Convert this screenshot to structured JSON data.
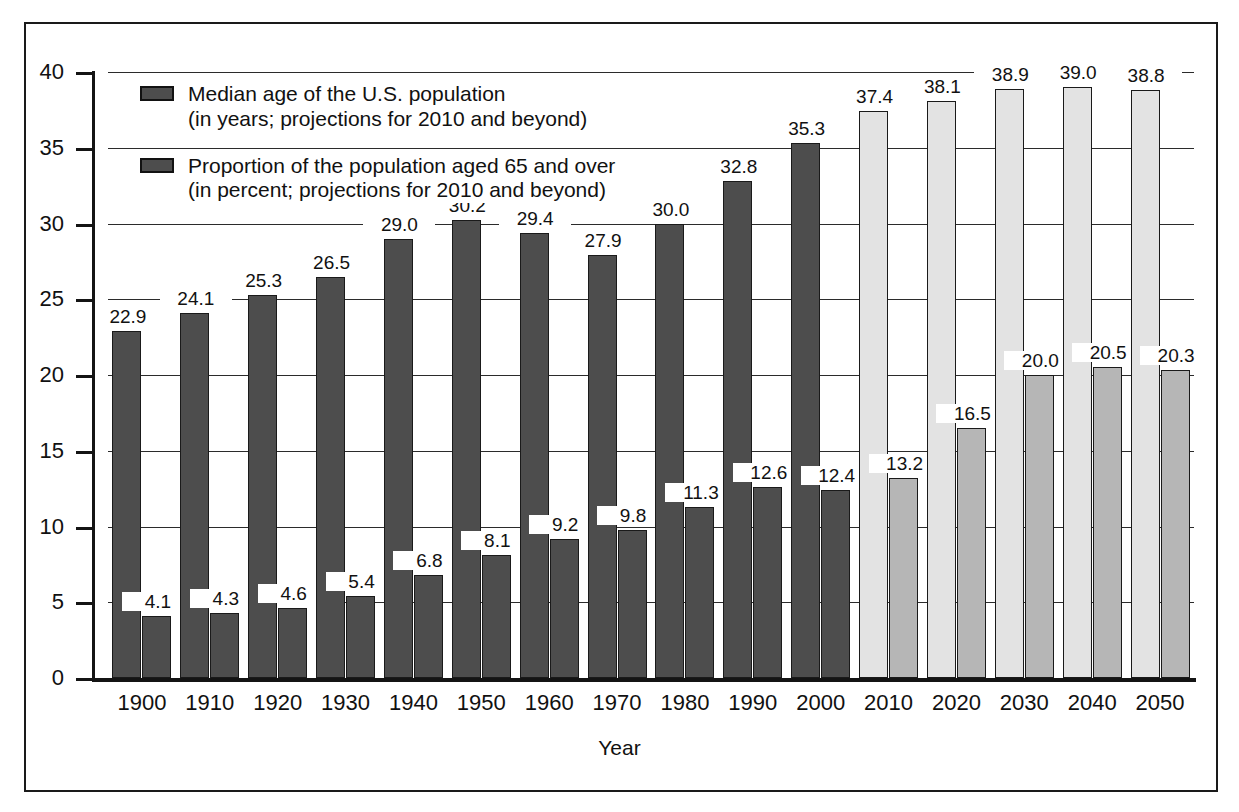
{
  "figure": {
    "frame_color": "#1a1a1a",
    "background": "#ffffff"
  },
  "legend": {
    "position": "inside-top-left",
    "entries": [
      {
        "swatch_color": "#4d4d4d",
        "line1": "Median age of the U.S. population",
        "line2": "(in years; projections for 2010 and beyond)"
      },
      {
        "swatch_color": "#4d4d4d",
        "line1": "Proportion of the population aged 65 and over",
        "line2": "(in percent; projections for 2010 and beyond)"
      }
    ]
  },
  "chart_data": {
    "type": "bar",
    "title": "",
    "subtitle": "",
    "xlabel": "Year",
    "ylabel": "",
    "ylim": [
      0,
      40
    ],
    "ytick_values": [
      0,
      5,
      10,
      15,
      20,
      25,
      30,
      35,
      40
    ],
    "ytick_labels": [
      "0",
      "5",
      "10",
      "15",
      "20",
      "25",
      "30",
      "35",
      "40"
    ],
    "grid": true,
    "grid_axis": "y",
    "legend_position": "upper left inside",
    "categories": [
      "1900",
      "1910",
      "1920",
      "1930",
      "1940",
      "1950",
      "1960",
      "1970",
      "1980",
      "1990",
      "2000",
      "2010",
      "2020",
      "2030",
      "2040",
      "2050"
    ],
    "projection_from": "2010",
    "series": [
      {
        "name": "Median age of the U.S. population",
        "unit": "years",
        "color": "#4d4d4d",
        "projection_color": "#e3e3e3",
        "values": [
          22.9,
          24.1,
          25.3,
          26.5,
          29.0,
          30.2,
          29.4,
          27.9,
          30.0,
          32.8,
          35.3,
          37.4,
          38.1,
          38.9,
          39.0,
          38.8
        ],
        "labels": [
          "22.9",
          "24.1",
          "25.3",
          "26.5",
          "29.0",
          "30.2",
          "29.4",
          "27.9",
          "30.0",
          "32.8",
          "35.3",
          "37.4",
          "38.1",
          "38.9",
          "39.0",
          "38.8"
        ]
      },
      {
        "name": "Proportion of the population aged 65 and over",
        "unit": "percent",
        "color": "#4d4d4d",
        "projection_color": "#b6b6b6",
        "values": [
          4.1,
          4.3,
          4.6,
          5.4,
          6.8,
          8.1,
          9.2,
          9.8,
          11.3,
          12.6,
          12.4,
          13.2,
          16.5,
          20.0,
          20.5,
          20.3
        ],
        "labels": [
          "4.1",
          "4.3",
          "4.6",
          "5.4",
          "6.8",
          "8.1",
          "9.2",
          "9.8",
          "11.3",
          "12.6",
          "12.4",
          "13.2",
          "16.5",
          "20.0",
          "20.5",
          "20.3"
        ]
      }
    ]
  }
}
